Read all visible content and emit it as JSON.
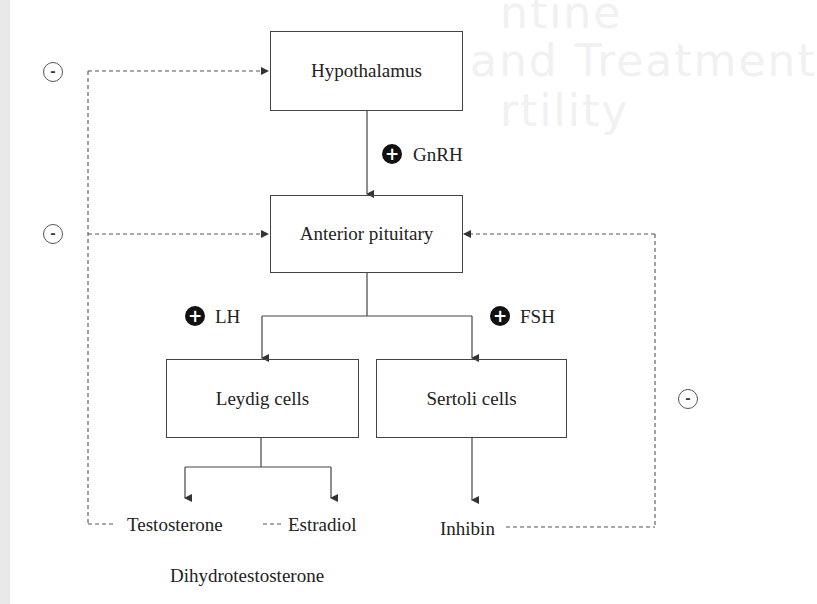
{
  "background": {
    "bleed_through_text": [
      "ntine",
      "and Treatment",
      "rtility"
    ]
  },
  "nodes": {
    "hypothalamus": "Hypothalamus",
    "anterior_pituitary": "Anterior pituitary",
    "leydig": "Leydig cells",
    "sertoli": "Sertoli cells"
  },
  "hormones": {
    "gnrh": "GnRH",
    "lh": "LH",
    "fsh": "FSH",
    "testosterone": "Testosterone",
    "estradiol": "Estradiol",
    "dht": "Dihydrotestosterone",
    "inhibin": "Inhibin"
  },
  "symbols": {
    "plus": "+",
    "minus": "-"
  },
  "colors": {
    "line": "#444444",
    "dashed": "#555555",
    "badge": "#111111"
  }
}
